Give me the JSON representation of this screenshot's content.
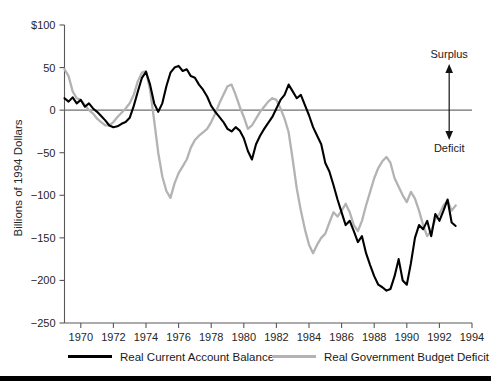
{
  "chart_data": {
    "type": "line",
    "title": "",
    "subtitle": "",
    "xlabel": "",
    "ylabel": "Billions of 1994 Dollars",
    "xlim": [
      1969.0,
      1994.0
    ],
    "ylim": [
      -250,
      100
    ],
    "grid": false,
    "legend_position": "below-axis",
    "y_ticks": [
      100,
      50,
      0,
      -50,
      -100,
      -150,
      -200,
      -250
    ],
    "y_tick_labels": [
      "$100",
      "50",
      "0",
      "-50",
      "-100",
      "-150",
      "-200",
      "-250"
    ],
    "x_ticks": [
      1970,
      1972,
      1974,
      1976,
      1978,
      1980,
      1982,
      1984,
      1986,
      1988,
      1990,
      1992,
      1994
    ],
    "x_tick_labels": [
      "1970",
      "1972",
      "1974",
      "1976",
      "1978",
      "1980",
      "1982",
      "1984",
      "1986",
      "1988",
      "1990",
      "1992",
      "1994"
    ],
    "zero_reference_line": 0,
    "annotations": [
      {
        "text": "Surplus",
        "x": 1992.6,
        "y": 78,
        "direction": "up"
      },
      {
        "text": "Deficit",
        "x": 1992.6,
        "y": -47,
        "direction": "down"
      }
    ],
    "series": [
      {
        "name": "Real Current Account Balance",
        "color": "#000000",
        "x": [
          1969.0,
          1969.25,
          1969.5,
          1969.75,
          1970.0,
          1970.25,
          1970.5,
          1970.75,
          1971.0,
          1971.25,
          1971.5,
          1971.75,
          1972.0,
          1972.25,
          1972.5,
          1972.75,
          1973.0,
          1973.25,
          1973.5,
          1973.75,
          1974.0,
          1974.25,
          1974.5,
          1974.75,
          1975.0,
          1975.25,
          1975.5,
          1975.75,
          1976.0,
          1976.25,
          1976.5,
          1976.75,
          1977.0,
          1977.25,
          1977.5,
          1977.75,
          1978.0,
          1978.25,
          1978.5,
          1978.75,
          1979.0,
          1979.25,
          1979.5,
          1979.75,
          1980.0,
          1980.25,
          1980.5,
          1980.75,
          1981.0,
          1981.25,
          1981.5,
          1981.75,
          1982.0,
          1982.25,
          1982.5,
          1982.75,
          1983.0,
          1983.25,
          1983.5,
          1983.75,
          1984.0,
          1984.25,
          1984.5,
          1984.75,
          1985.0,
          1985.25,
          1985.5,
          1985.75,
          1986.0,
          1986.25,
          1986.5,
          1986.75,
          1987.0,
          1987.25,
          1987.5,
          1987.75,
          1988.0,
          1988.25,
          1988.5,
          1988.75,
          1989.0,
          1989.25,
          1989.5,
          1989.75,
          1990.0,
          1990.25,
          1990.5,
          1990.75,
          1991.0,
          1991.25,
          1991.5,
          1991.75,
          1992.0,
          1992.25,
          1992.5,
          1992.75,
          1993.0
        ],
        "y": [
          14,
          10,
          15,
          8,
          12,
          4,
          8,
          2,
          -2,
          -7,
          -12,
          -18,
          -20,
          -19,
          -16,
          -14,
          -9,
          5,
          22,
          38,
          45,
          30,
          8,
          -2,
          8,
          28,
          44,
          50,
          52,
          46,
          48,
          40,
          38,
          30,
          24,
          16,
          5,
          -2,
          -8,
          -14,
          -22,
          -25,
          -20,
          -24,
          -33,
          -48,
          -58,
          -40,
          -30,
          -22,
          -15,
          -8,
          2,
          12,
          18,
          30,
          22,
          14,
          18,
          6,
          -6,
          -20,
          -30,
          -40,
          -62,
          -72,
          -88,
          -105,
          -120,
          -135,
          -130,
          -142,
          -155,
          -148,
          -168,
          -182,
          -195,
          -205,
          -208,
          -212,
          -210,
          -195,
          -175,
          -200,
          -205,
          -180,
          -150,
          -135,
          -140,
          -130,
          -148,
          -122,
          -130,
          -118,
          -105,
          -132,
          -136
        ],
        "units": "billions of 1994 dollars"
      },
      {
        "name": "Real Government Budget Deficit",
        "color": "#b3b3b3",
        "x": [
          1969.0,
          1969.25,
          1969.5,
          1969.75,
          1970.0,
          1970.25,
          1970.5,
          1970.75,
          1971.0,
          1971.25,
          1971.5,
          1971.75,
          1972.0,
          1972.25,
          1972.5,
          1972.75,
          1973.0,
          1973.25,
          1973.5,
          1973.75,
          1974.0,
          1974.25,
          1974.5,
          1974.75,
          1975.0,
          1975.25,
          1975.5,
          1975.75,
          1976.0,
          1976.25,
          1976.5,
          1976.75,
          1977.0,
          1977.25,
          1977.5,
          1977.75,
          1978.0,
          1978.25,
          1978.5,
          1978.75,
          1979.0,
          1979.25,
          1979.5,
          1979.75,
          1980.0,
          1980.25,
          1980.5,
          1980.75,
          1981.0,
          1981.25,
          1981.5,
          1981.75,
          1982.0,
          1982.25,
          1982.5,
          1982.75,
          1983.0,
          1983.25,
          1983.5,
          1983.75,
          1984.0,
          1984.25,
          1984.5,
          1984.75,
          1985.0,
          1985.25,
          1985.5,
          1985.75,
          1986.0,
          1986.25,
          1986.5,
          1986.75,
          1987.0,
          1987.25,
          1987.5,
          1987.75,
          1988.0,
          1988.25,
          1988.5,
          1988.75,
          1989.0,
          1989.25,
          1989.5,
          1989.75,
          1990.0,
          1990.25,
          1990.5,
          1990.75,
          1991.0,
          1991.25,
          1991.5,
          1991.75,
          1992.0,
          1992.25,
          1992.5,
          1992.75,
          1993.0
        ],
        "y": [
          48,
          40,
          22,
          14,
          12,
          6,
          0,
          -4,
          -10,
          -14,
          -18,
          -18,
          -14,
          -8,
          -3,
          2,
          8,
          18,
          34,
          44,
          46,
          24,
          -12,
          -50,
          -78,
          -95,
          -103,
          -86,
          -74,
          -66,
          -58,
          -44,
          -35,
          -30,
          -26,
          -22,
          -14,
          -4,
          8,
          18,
          28,
          30,
          18,
          4,
          -8,
          -22,
          -18,
          -10,
          -2,
          4,
          10,
          14,
          12,
          2,
          -10,
          -26,
          -58,
          -92,
          -118,
          -140,
          -158,
          -168,
          -158,
          -150,
          -145,
          -132,
          -120,
          -125,
          -118,
          -110,
          -120,
          -135,
          -142,
          -130,
          -112,
          -96,
          -80,
          -68,
          -60,
          -55,
          -62,
          -80,
          -90,
          -100,
          -108,
          -96,
          -104,
          -118,
          -135,
          -148,
          -142,
          -128,
          -122,
          -112,
          -106,
          -118,
          -112
        ],
        "units": "billions of 1994 dollars"
      }
    ]
  },
  "legend": {
    "entries": [
      {
        "label": "Real Current Account Balance",
        "color": "#000000"
      },
      {
        "label": "Real Government Budget Deficit",
        "color": "#b3b3b3"
      }
    ]
  },
  "axis": {
    "y_title": "Billions of 1994 Dollars"
  },
  "annotations": {
    "surplus_label": "Surplus",
    "deficit_label": "Deficit"
  },
  "colors": {
    "series_black": "#000000",
    "series_gray": "#b3b3b3",
    "axis": "#58585a",
    "background": "#ffffff"
  }
}
